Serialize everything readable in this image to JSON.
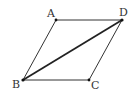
{
  "diagram": {
    "type": "parallelogram",
    "title": "",
    "vertices": {
      "A": {
        "label": "A",
        "x": 56,
        "y": 20,
        "label_x": 47,
        "label_y": 17
      },
      "D": {
        "label": "D",
        "x": 122,
        "y": 20,
        "label_x": 119,
        "label_y": 16
      },
      "B": {
        "label": "B",
        "x": 23,
        "y": 80,
        "label_x": 12,
        "label_y": 88
      },
      "C": {
        "label": "C",
        "x": 89,
        "y": 80,
        "label_x": 91,
        "label_y": 89
      }
    },
    "edges": [
      {
        "from": "A",
        "to": "D",
        "kind": "side"
      },
      {
        "from": "A",
        "to": "B",
        "kind": "side"
      },
      {
        "from": "B",
        "to": "C",
        "kind": "side"
      },
      {
        "from": "D",
        "to": "C",
        "kind": "side"
      },
      {
        "from": "B",
        "to": "D",
        "kind": "diagonal"
      }
    ],
    "colors": {
      "line": "#333333",
      "diagonal": "#222222",
      "point": "#111111",
      "label": "#333333",
      "background": "#ffffff"
    }
  }
}
